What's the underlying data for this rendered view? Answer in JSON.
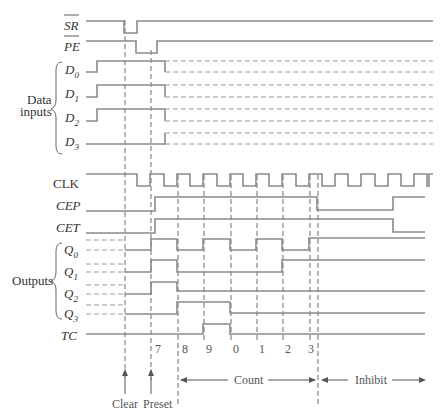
{
  "diagram": {
    "type": "timing-diagram",
    "signals": {
      "sr": {
        "label": "SR",
        "overbar": true
      },
      "pe": {
        "label": "PE",
        "overbar": true
      },
      "d0": {
        "label": "D",
        "sub": "0"
      },
      "d1": {
        "label": "D",
        "sub": "1"
      },
      "d2": {
        "label": "D",
        "sub": "2"
      },
      "d3": {
        "label": "D",
        "sub": "3"
      },
      "clk": {
        "label": "CLK"
      },
      "cep": {
        "label": "CEP"
      },
      "cet": {
        "label": "CET"
      },
      "q0": {
        "label": "Q",
        "sub": "0"
      },
      "q1": {
        "label": "Q",
        "sub": "1"
      },
      "q2": {
        "label": "Q",
        "sub": "2"
      },
      "q3": {
        "label": "Q",
        "sub": "3"
      },
      "tc": {
        "label": "TC"
      }
    },
    "groups": {
      "data_inputs_line1": "Data",
      "data_inputs_line2": "inputs",
      "outputs": "Outputs"
    },
    "count_states": [
      "7",
      "8",
      "9",
      "0",
      "1",
      "2",
      "3"
    ],
    "markers": {
      "clear": "Clear",
      "preset": "Preset",
      "count": "Count",
      "inhibit": "Inhibit"
    }
  }
}
